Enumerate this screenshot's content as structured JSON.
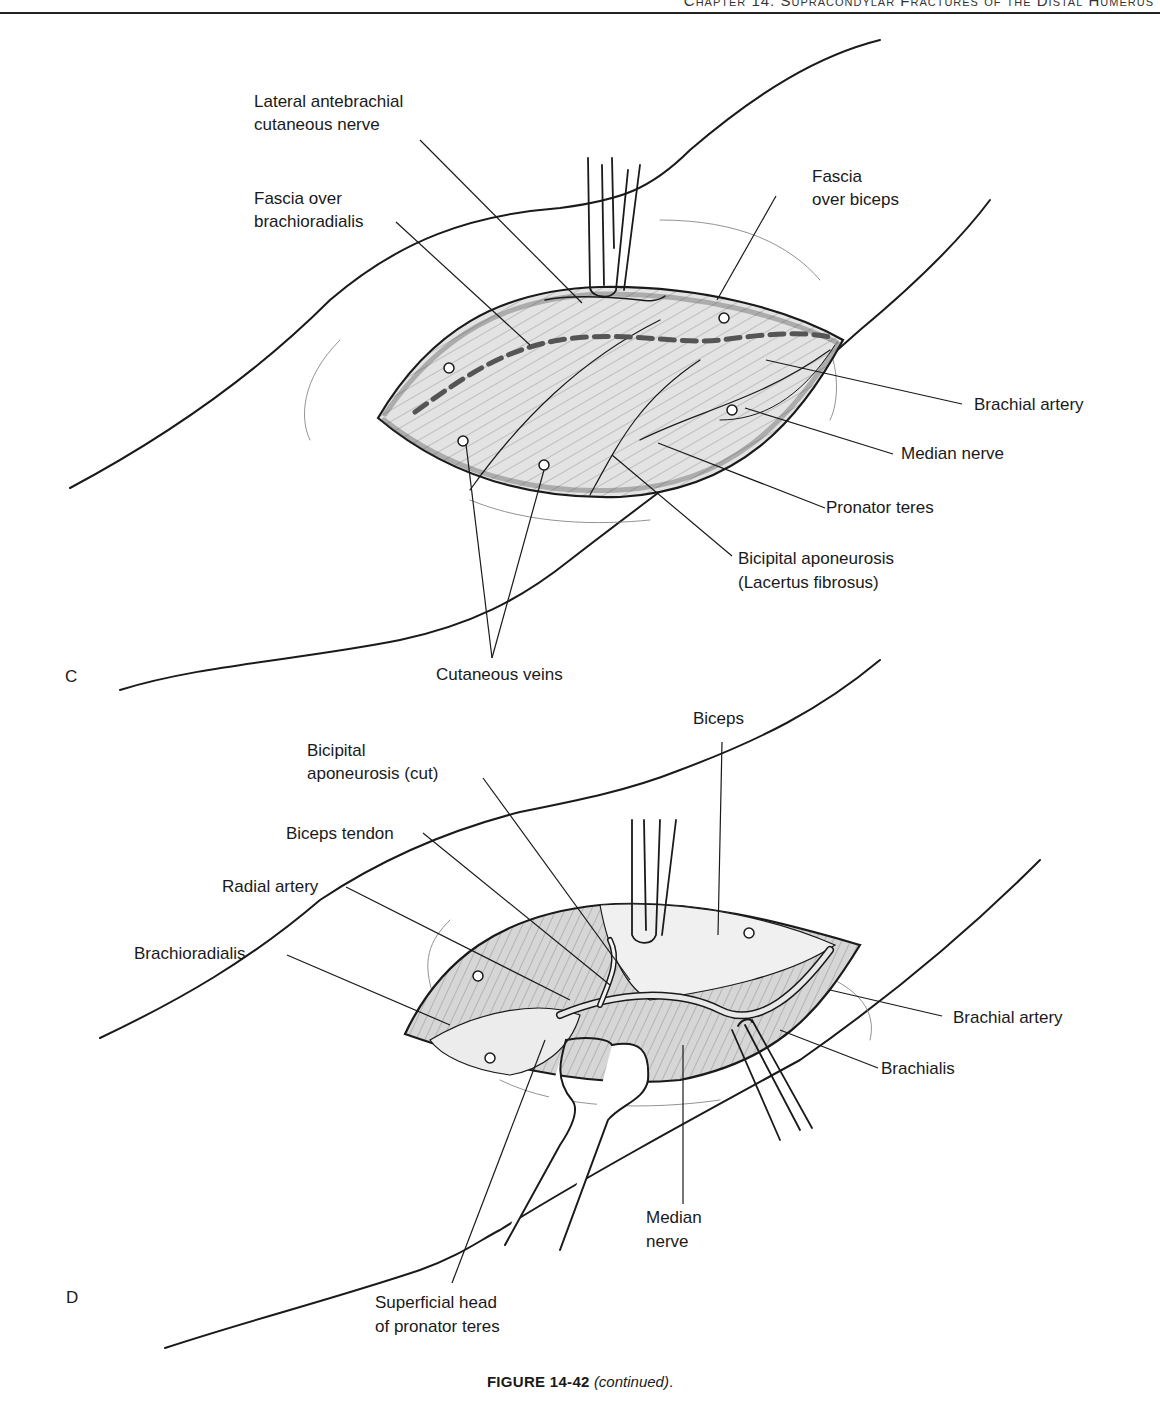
{
  "header": {
    "running_head": "Chapter 14: Supracondylar Fractures of the Distal Humerus"
  },
  "panels": {
    "c": {
      "letter": "C",
      "labels": {
        "lateral_antebrachial_line1": "Lateral antebrachial",
        "lateral_antebrachial_line2": "cutaneous nerve",
        "fascia_brachioradialis_line1": "Fascia over",
        "fascia_brachioradialis_line2": "brachioradialis",
        "fascia_biceps_line1": "Fascia",
        "fascia_biceps_line2": "over biceps",
        "brachial_artery": "Brachial artery",
        "median_nerve": "Median nerve",
        "pronator_teres": "Pronator teres",
        "bicipital_aponeurosis_line1": "Bicipital aponeurosis",
        "bicipital_aponeurosis_line2": "(Lacertus fibrosus)",
        "cutaneous_veins": "Cutaneous veins"
      }
    },
    "d": {
      "letter": "D",
      "labels": {
        "biceps": "Biceps",
        "bicipital_cut_line1": "Bicipital",
        "bicipital_cut_line2": "aponeurosis (cut)",
        "biceps_tendon": "Biceps tendon",
        "radial_artery": "Radial artery",
        "brachioradialis": "Brachioradialis",
        "brachial_artery": "Brachial artery",
        "brachialis": "Brachialis",
        "median_nerve_line1": "Median",
        "median_nerve_line2": "nerve",
        "superficial_head_line1": "Superficial head",
        "superficial_head_line2": "of pronator teres"
      }
    }
  },
  "caption": {
    "figure_number": "FIGURE 14-42",
    "note": "(continued)",
    "end": "."
  },
  "colors": {
    "ink": "#1a1a1a",
    "tissue_fill": "#e3e3e3",
    "tissue_dark": "#cfcfcf",
    "incision_dash": "#555555"
  }
}
